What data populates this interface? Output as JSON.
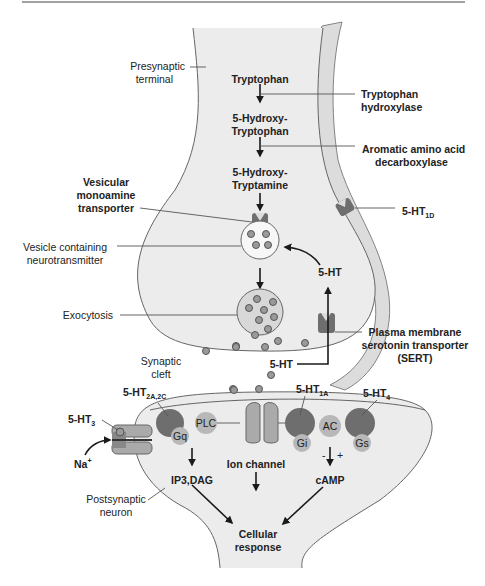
{
  "figure": {
    "colors": {
      "cell_fill": "#ececec",
      "glial_fill": "#dcdcdc",
      "receptor_dark": "#6e6e6e",
      "protein_light": "#b8b8b8",
      "vesicle_fill": "#f5f5f5",
      "outline": "#666666",
      "text": "#222222"
    },
    "labels": {
      "presynaptic_1": "Presynaptic",
      "presynaptic_2": "terminal",
      "tryptophan": "Tryptophan",
      "enzyme1_1": "Tryptophan",
      "enzyme1_2": "hydroxylase",
      "htp_1": "5-Hydroxy-",
      "htp_2": "Tryptophan",
      "enzyme2_1": "Aromatic amino acid",
      "enzyme2_2": "decarboxylase",
      "ht_1": "5-Hydroxy-",
      "ht_2": "Tryptamine",
      "vmat_1": "Vesicular",
      "vmat_2": "monoamine",
      "vmat_3": "transporter",
      "vesicle_1": "Vesicle containing",
      "vesicle_2": "neurotransmitter",
      "exocytosis": "Exocytosis",
      "ht1d": "5-HT",
      "ht1d_sub": "1D",
      "reuptake_5ht": "5-HT",
      "cleft_5ht": "5-HT",
      "sert_1": "Plasma membrane",
      "sert_2": "serotonin transporter",
      "sert_3": "(SERT)",
      "cleft_1": "Synaptic",
      "cleft_2": "cleft",
      "ht2": "5-HT",
      "ht2_sub": "2A,2C",
      "ht3": "5-HT",
      "ht3_sub": "3",
      "ht1a": "5-HT",
      "ht1a_sub": "1A",
      "ht4": "5-HT",
      "ht4_sub": "4",
      "na": "Na",
      "na_sup": "+",
      "plc": "PLC",
      "gq": "Gq",
      "ac": "AC",
      "gi": "Gi",
      "gs": "Gs",
      "minus": "-",
      "plus": "+",
      "ip3": "IP3,DAG",
      "ion_channel": "Ion channel",
      "camp": "cAMP",
      "postsynaptic_1": "Postsynaptic",
      "postsynaptic_2": "neuron",
      "cellular_1": "Cellular",
      "cellular_2": "response"
    }
  }
}
